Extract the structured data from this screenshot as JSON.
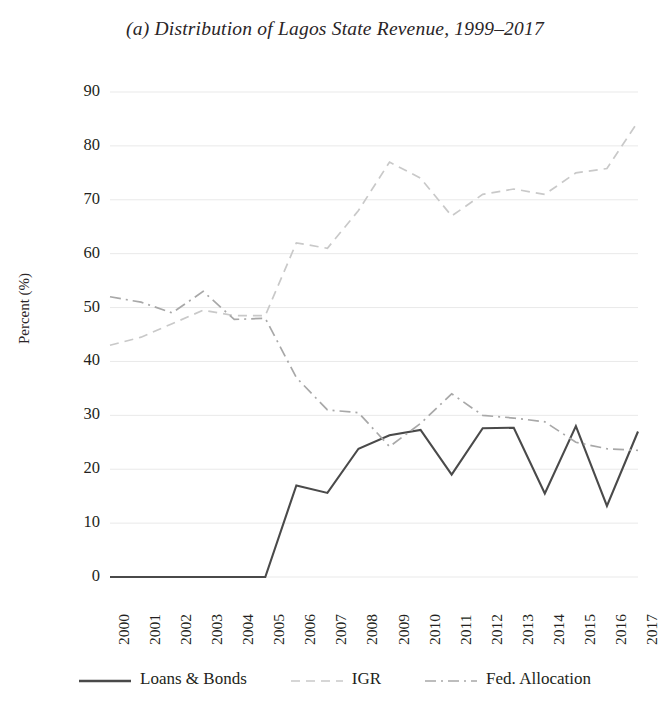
{
  "chart_data": {
    "type": "line",
    "title": "(a) Distribution of Lagos State Revenue, 1999–2017",
    "xlabel": "",
    "ylabel": "Percent (%)",
    "ylim": [
      0,
      90
    ],
    "ytick_values": [
      0,
      10,
      20,
      30,
      40,
      50,
      60,
      70,
      80,
      90
    ],
    "ytick_labels": [
      "0",
      "10",
      "20",
      "30",
      "40",
      "50",
      "60",
      "70",
      "80",
      "90"
    ],
    "categories": [
      "2000",
      "2001",
      "2002",
      "2003",
      "2004",
      "2005",
      "2006",
      "2007",
      "2008",
      "2009",
      "2010",
      "2011",
      "2012",
      "2013",
      "2014",
      "2015",
      "2016",
      "2017"
    ],
    "grid": true,
    "grid_axis": "y",
    "legend_position": "bottom",
    "series": [
      {
        "name": "Loans & Bonds",
        "style": "solid",
        "color": "#4a4a4a",
        "values": [
          0,
          0,
          0,
          0,
          0,
          0,
          17,
          15.6,
          23.8,
          26.3,
          27.3,
          19,
          27.6,
          27.7,
          15.5,
          28,
          13.2,
          27
        ]
      },
      {
        "name": "IGR",
        "style": "dashed",
        "color": "#c9c9c9",
        "values": [
          43,
          44.5,
          47,
          49.5,
          48.5,
          48.5,
          62,
          61,
          68,
          77,
          74,
          67,
          71,
          72,
          71,
          75,
          75.8,
          84.5
        ]
      },
      {
        "name": "Fed. Allocation",
        "style": "dashdot",
        "color": "#a8a8a8",
        "values": [
          52,
          51,
          49,
          53,
          47.8,
          48,
          37,
          31,
          30.5,
          24.2,
          28.5,
          34,
          30,
          29.5,
          28.8,
          25,
          23.8,
          23.5
        ]
      }
    ]
  },
  "legend": {
    "entries": [
      {
        "label": "Loans & Bonds",
        "style": "solid"
      },
      {
        "label": "IGR",
        "style": "dashed"
      },
      {
        "label": "Fed. Allocation",
        "style": "dashdot"
      }
    ]
  },
  "colors": {
    "loans_bonds": "#4a4a4a",
    "igr": "#c9c9c9",
    "fed_allocation": "#a8a8a8",
    "grid": "#e9e9e9",
    "text": "#231f20"
  }
}
